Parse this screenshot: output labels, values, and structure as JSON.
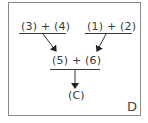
{
  "diagram": {
    "corner_label": "D",
    "nodes": [
      {
        "id": "top-left",
        "label": "(3) + (4)"
      },
      {
        "id": "top-right",
        "label": "(1) + (2)"
      },
      {
        "id": "middle",
        "label": "(5) + (6)"
      },
      {
        "id": "result",
        "label": "(C)"
      }
    ],
    "edges": [
      {
        "from": "top-left",
        "to": "middle"
      },
      {
        "from": "top-right",
        "to": "middle"
      },
      {
        "from": "middle",
        "to": "result"
      }
    ],
    "colors": {
      "line": "#3a3a3a",
      "border": "#8a8a8a"
    }
  }
}
